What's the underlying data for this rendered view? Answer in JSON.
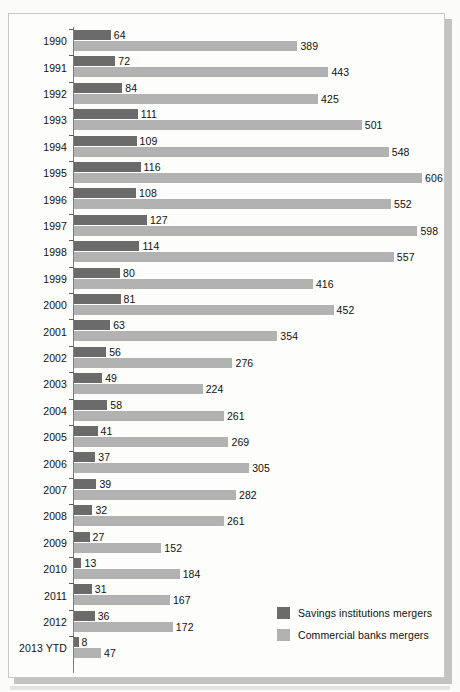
{
  "chart_data": {
    "type": "bar",
    "orientation": "horizontal",
    "title": "",
    "subtitle": "",
    "xlabel": "",
    "ylabel": "",
    "grid": false,
    "legend_position": "bottom-right",
    "xlim": [
      0,
      606
    ],
    "axis_max": 606,
    "categories": [
      "1990",
      "1991",
      "1992",
      "1993",
      "1994",
      "1995",
      "1996",
      "1997",
      "1998",
      "1999",
      "2000",
      "2001",
      "2002",
      "2003",
      "2004",
      "2005",
      "2006",
      "2007",
      "2008",
      "2009",
      "2010",
      "2011",
      "2012",
      "2013 YTD"
    ],
    "series": [
      {
        "name": "Savings institutions mergers",
        "color": "#6b6b6b",
        "values": [
          64,
          72,
          84,
          111,
          109,
          116,
          108,
          127,
          114,
          80,
          81,
          63,
          56,
          49,
          58,
          41,
          37,
          39,
          32,
          27,
          13,
          31,
          36,
          8
        ]
      },
      {
        "name": "Commercial banks mergers",
        "color": "#b2b2b2",
        "values": [
          389,
          443,
          425,
          501,
          548,
          606,
          552,
          598,
          557,
          416,
          452,
          354,
          276,
          224,
          261,
          269,
          305,
          282,
          261,
          152,
          184,
          167,
          172,
          47
        ]
      }
    ]
  },
  "legend": {
    "items": [
      {
        "label": "Savings institutions mergers",
        "color": "#6b6b6b"
      },
      {
        "label": "Commercial banks mergers",
        "color": "#b2b2b2"
      }
    ]
  },
  "colors": {
    "series_dark": "#6b6b6b",
    "series_light": "#b2b2b2",
    "panel_background": "#fdfdfc",
    "panel_border": "#c8c8c6",
    "axis_line": "#7d7d7d",
    "text": "#111111",
    "page_background": "#fbfbfa"
  }
}
